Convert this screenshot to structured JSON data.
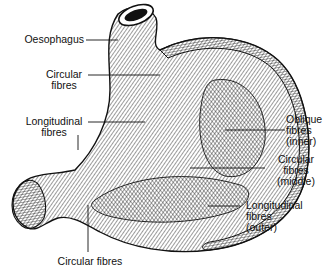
{
  "diagram": {
    "labels": {
      "oesophagus": "Oesophagus",
      "circular_top": [
        "Circular",
        "fibres"
      ],
      "longitudinal_left": [
        "Longitudinal",
        "fibres"
      ],
      "oblique_inner": [
        "Oblique",
        "fibres",
        "(inner)"
      ],
      "circular_middle": [
        "Circular",
        "fibres",
        "(middle)"
      ],
      "longitudinal_outer": [
        "Longitudinal",
        "fibres",
        "(outer)"
      ],
      "circular_bottom": "Circular fibres"
    },
    "colors": {
      "ink": "#111111",
      "background": "#ffffff"
    }
  }
}
